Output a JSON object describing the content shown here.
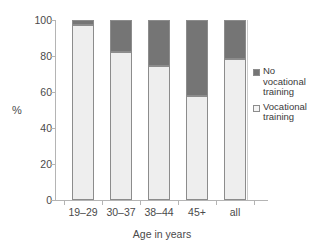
{
  "chart_data": {
    "type": "bar",
    "subtype": "stacked-percent",
    "title": "",
    "xlabel": "Age in years",
    "ylabel": "%",
    "categories": [
      "19–29",
      "30–37",
      "38–44",
      "45+",
      "all"
    ],
    "series": [
      {
        "name": "Vocational training",
        "color": "#eeeeee",
        "values": [
          97.5,
          82.5,
          74.5,
          58,
          78.5
        ]
      },
      {
        "name": "No vocational training",
        "color": "#757575",
        "values": [
          2.5,
          17.5,
          25.5,
          42,
          21.5
        ]
      }
    ],
    "ylim": [
      0,
      100
    ],
    "yticks": [
      0,
      20,
      40,
      60,
      80,
      100
    ],
    "ytick_labels": [
      "0",
      "20",
      "40",
      "60",
      "80",
      "100"
    ],
    "grid": false,
    "legend_position": "right"
  },
  "legend": {
    "entries": [
      {
        "label": "No\nvocational\ntraining",
        "swatch": "dark-filled-square",
        "color": "#757575"
      },
      {
        "label": "Vocational\ntraining",
        "swatch": "light-outlined-square",
        "color": "#f4f4f4"
      }
    ]
  },
  "colors": {
    "dark_segment": "#757575",
    "light_segment": "#eeeeee",
    "segment_border": "#8c8c8c",
    "axis": "#b4b4b4",
    "text": "#4a4a4a",
    "background": "#ffffff"
  }
}
